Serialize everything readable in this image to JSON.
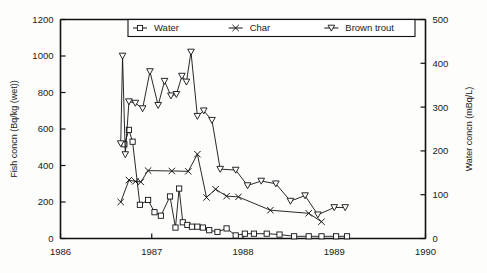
{
  "chart_data": {
    "type": "line",
    "title": "",
    "xlabel": "",
    "ylabel": "Fish concn (Bq/kg (wet))",
    "y2label": "Water concn (mBq/L)",
    "xlim": [
      1986,
      1990
    ],
    "ylim": [
      0,
      1200
    ],
    "y2lim": [
      0,
      500
    ],
    "grid": false,
    "legend_position": "top-center",
    "xticks": [
      "1986",
      "1987",
      "1988",
      "1989",
      "1990"
    ],
    "xtick_values": [
      1986,
      1987,
      1988,
      1989,
      1990
    ],
    "yticks": [
      "0",
      "200",
      "400",
      "600",
      "800",
      "1000",
      "1200"
    ],
    "ytick_values": [
      0,
      200,
      400,
      600,
      800,
      1000,
      1200
    ],
    "y2ticks": [
      "0",
      "100",
      "200",
      "300",
      "400",
      "500"
    ],
    "y2tick_values": [
      0,
      100,
      200,
      300,
      400,
      500
    ],
    "series": [
      {
        "name": "Water",
        "marker": "open-square",
        "axis": "right",
        "units": "mBq/L",
        "x": [
          1986.7,
          1986.75,
          1986.79,
          1986.87,
          1986.96,
          1987.03,
          1987.1,
          1987.2,
          1987.26,
          1987.3,
          1987.34,
          1987.39,
          1987.44,
          1987.5,
          1987.56,
          1987.63,
          1987.72,
          1987.82,
          1987.92,
          1988.02,
          1988.12,
          1988.26,
          1988.4,
          1988.56,
          1988.72,
          1988.86,
          1989.02,
          1989.14
        ],
        "values": [
          215,
          248,
          221,
          77,
          88,
          60,
          52,
          96,
          25,
          114,
          37,
          31,
          27,
          27,
          25,
          19,
          15,
          23,
          7,
          11,
          11,
          11,
          9,
          5,
          5,
          5,
          5,
          5
        ]
      },
      {
        "name": "Char",
        "marker": "x",
        "axis": "left",
        "units": "Bq/kg (wet)",
        "x": [
          1986.66,
          1986.75,
          1986.82,
          1986.88,
          1986.96,
          1987.22,
          1987.4,
          1987.5,
          1987.6,
          1987.7,
          1987.82,
          1987.95,
          1988.3,
          1988.72,
          1988.86
        ],
        "values": [
          200,
          320,
          313,
          310,
          372,
          370,
          368,
          462,
          225,
          270,
          232,
          228,
          155,
          138,
          92
        ]
      },
      {
        "name": "Brown trout",
        "marker": "triangle-down",
        "axis": "left",
        "units": "Bq/kg (wet)",
        "x": [
          1986.66,
          1986.68,
          1986.71,
          1986.75,
          1986.82,
          1986.9,
          1986.98,
          1987.07,
          1987.14,
          1987.21,
          1987.27,
          1987.33,
          1987.38,
          1987.43,
          1987.5,
          1987.57,
          1987.66,
          1987.75,
          1987.92,
          1988.05,
          1988.2,
          1988.36,
          1988.52,
          1988.68,
          1988.82,
          1989.0,
          1989.12
        ],
        "values": [
          520,
          1000,
          460,
          750,
          742,
          712,
          915,
          730,
          862,
          782,
          790,
          890,
          858,
          1022,
          670,
          700,
          648,
          380,
          375,
          290,
          315,
          300,
          205,
          235,
          130,
          170,
          170
        ]
      }
    ]
  },
  "legend": {
    "items": [
      {
        "label": "Water",
        "marker": "open-square"
      },
      {
        "label": "Char",
        "marker": "x"
      },
      {
        "label": "Brown trout",
        "marker": "triangle-down"
      }
    ]
  },
  "axes": {
    "left_title": "Fish concn (Bq/kg (wet))",
    "right_title": "Water concn (mBq/L)"
  }
}
